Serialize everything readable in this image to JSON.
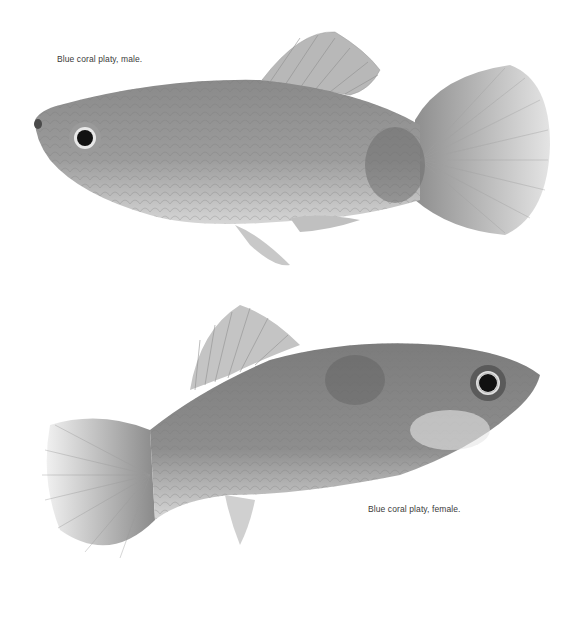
{
  "page": {
    "background": "#ffffff",
    "figures": [
      {
        "id": "male",
        "caption": "Blue coral platy, male.",
        "subject": "platy-fish-male-photo",
        "orientation": "facing-left"
      },
      {
        "id": "female",
        "caption": "Blue coral platy, female.",
        "subject": "platy-fish-female-photo",
        "orientation": "facing-right"
      }
    ]
  }
}
